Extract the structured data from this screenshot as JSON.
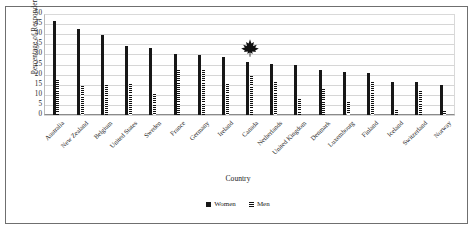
{
  "chart_data": {
    "type": "bar",
    "title": "",
    "xlabel": "Country",
    "ylabel": "Percentage of Respondents",
    "ylim": [
      0,
      50
    ],
    "yticks": [
      0,
      5,
      10,
      15,
      20,
      25,
      30,
      35,
      40,
      45,
      50
    ],
    "grid": true,
    "legend_position": "bottom",
    "categories": [
      "Australia",
      "New Zealand",
      "Belgium",
      "United States",
      "Sweden",
      "France",
      "Germany",
      "Ireland",
      "Canada",
      "Netherlands",
      "United Kingdom",
      "Denmark",
      "Luxembourg",
      "Finland",
      "Iceland",
      "Switzerland",
      "Norway"
    ],
    "series": [
      {
        "name": "Women",
        "values": [
          46.5,
          42.5,
          39.8,
          34.0,
          33.0,
          30.4,
          29.8,
          28.7,
          26.4,
          25.3,
          24.6,
          22.4,
          21.5,
          20.6,
          16.3,
          16.1,
          14.8
        ]
      },
      {
        "name": "Men",
        "values": [
          17.4,
          14.4,
          14.8,
          15.3,
          10.2,
          22.4,
          22.1,
          15.6,
          19.4,
          16.4,
          7.8,
          13.1,
          6.6,
          16.2,
          2.6,
          12.0,
          1.8
        ]
      }
    ],
    "annotations": [
      {
        "name": "maple-leaf",
        "label": "Canada",
        "category": "Canada",
        "color": "#111111"
      }
    ]
  },
  "axes": {
    "y_title": "Percentage of Respondents",
    "x_title": "Country",
    "y_tick_labels": [
      "50",
      "45",
      "40",
      "35",
      "30",
      "25",
      "20",
      "15",
      "10",
      "5",
      "0"
    ]
  },
  "legend": {
    "items": [
      {
        "label": "Women",
        "pattern": "solid",
        "color": "#171717"
      },
      {
        "label": "Men",
        "pattern": "striped",
        "color": "#111111"
      }
    ]
  }
}
